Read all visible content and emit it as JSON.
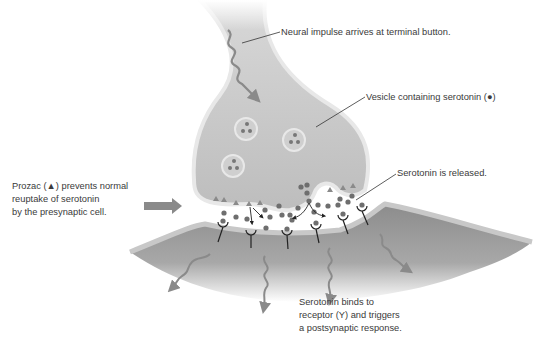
{
  "diagram": {
    "colors": {
      "background": "#ffffff",
      "presynaptic_fill": "#c4c4c4",
      "presynaptic_edge": "#e6e6e6",
      "postsynaptic_fill": "#9a9a9a",
      "postsynaptic_edge": "#c8c8c8",
      "serotonin_dot": "#6e6e6e",
      "prozac_triangle": "#8a8a8a",
      "impulse_arrow": "#8a8a8a",
      "leader_line": "#333333",
      "text": "#3a3a3a"
    },
    "labels": {
      "neural_impulse": "Neural impulse arrives at terminal button.",
      "vesicle": "Vesicle containing serotonin (●)",
      "released": "Serotonin is released.",
      "prozac": [
        "Prozac (▲) prevents normal",
        "reuptake of serotonin",
        "by the presynaptic cell."
      ],
      "binds": [
        "Serotonin binds to",
        "receptor (Υ) and triggers",
        "a postsynaptic response."
      ]
    },
    "components": {
      "vesicles": 3,
      "receptors": 6,
      "postsynaptic_impulses": 4
    }
  }
}
